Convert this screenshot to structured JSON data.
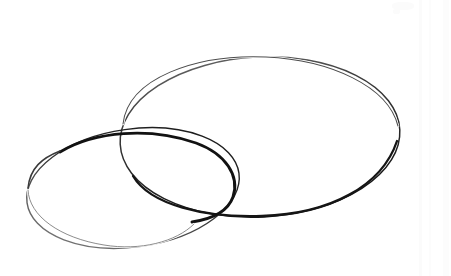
{
  "figure": {
    "title": "Two overlapping hand-drawn ellipses",
    "background_color": "#ffffff",
    "stroke_color_dark": "#1f1f1f",
    "stroke_color_light": "#555555",
    "width": 451,
    "height": 276,
    "shapes": [
      {
        "id": "large-ellipse",
        "label": "Large ellipse",
        "center_x": 260,
        "center_y": 137,
        "radius_x": 140,
        "radius_y": 80,
        "rotation_deg": -3,
        "bounds": {
          "left": 120,
          "top": 57,
          "right": 400,
          "bottom": 216
        },
        "stroke_min_width": 0.8,
        "stroke_max_width": 2.6,
        "stroke_color": "#1f1f1f"
      },
      {
        "id": "small-ellipse",
        "label": "Small ellipse",
        "center_x": 133,
        "center_y": 188,
        "radius_x": 107,
        "radius_y": 59,
        "rotation_deg": -8,
        "bounds": {
          "left": 26,
          "top": 128,
          "right": 240,
          "bottom": 248
        },
        "stroke_min_width": 0.6,
        "stroke_max_width": 3.2,
        "stroke_color": "#1f1f1f"
      }
    ],
    "intersections": [
      {
        "id": "intersection-upper",
        "x": 121,
        "y": 128
      },
      {
        "id": "intersection-lower",
        "x": 231,
        "y": 213
      }
    ],
    "overlap_region_label": "Lens-shaped overlap"
  }
}
